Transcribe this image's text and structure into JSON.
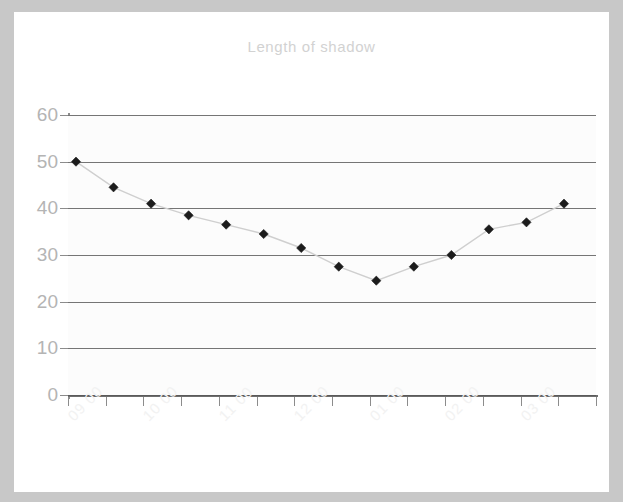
{
  "chart_data": {
    "type": "line",
    "title": "Length of shadow",
    "xlabel": "",
    "ylabel": "",
    "ylim": [
      0,
      60
    ],
    "ytick_labels": [
      "60",
      "50",
      "40",
      "30",
      "20",
      "10",
      "0"
    ],
    "ytick_values": [
      60,
      50,
      40,
      30,
      20,
      10,
      0
    ],
    "grid": true,
    "legend": false,
    "marker": "diamond",
    "marker_color": "#1c1c1c",
    "line_color": "#cfcfcf",
    "title_color": "#d2d2d2",
    "axis_label_color": "#b4b4b4",
    "xtick_label_color": "#f2f2f2",
    "xtick_label_rotation": -45,
    "x_tick_count": 15,
    "categories": [
      "09 00",
      "",
      "10 00",
      "",
      "11 00",
      "",
      "12 00",
      "",
      "01 00",
      "",
      "02 00",
      "",
      "03 00",
      ""
    ],
    "xtick_labels_shown": [
      "09 00",
      "10 00",
      "11 00",
      "12 00",
      "01 00",
      "02 00",
      "03 00"
    ],
    "series": [
      {
        "name": "Length of shadow",
        "x": [
          "09 00",
          "09 30",
          "10 00",
          "10 30",
          "11 00",
          "11 30",
          "12 00",
          "12 30",
          "01 00",
          "01 30",
          "02 00",
          "02 30",
          "03 00",
          "03 30"
        ],
        "values": [
          50,
          44.5,
          41,
          38.5,
          36.5,
          34.5,
          31.5,
          27.5,
          24.5,
          27.5,
          30,
          35.5,
          37,
          41
        ]
      }
    ]
  }
}
